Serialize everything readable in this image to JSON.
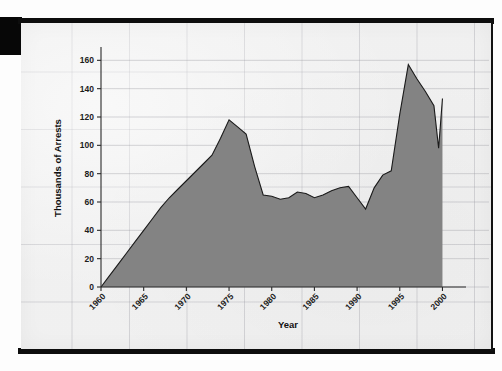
{
  "page": {
    "kind": "scanned-figure-page",
    "background_color": "#fdfdfd",
    "sheet_color": "#f4f4f4",
    "artifact_color": "#0d0d0d"
  },
  "chart_data": {
    "type": "area",
    "title": "",
    "subtitle": "",
    "xlabel": "Year",
    "ylabel": "Thousands of Arrests",
    "xlim": [
      1960,
      2001
    ],
    "ylim": [
      0,
      168
    ],
    "grid": true,
    "legend": null,
    "series_color": "#838383",
    "line_color": "#1a1a1a",
    "yticks": [
      0,
      20,
      40,
      60,
      80,
      100,
      120,
      140,
      160
    ],
    "ytick_labels": [
      "0",
      "20",
      "40",
      "60",
      "80",
      "100",
      "120",
      "140",
      "160"
    ],
    "xticks": [
      1960,
      1965,
      1970,
      1975,
      1980,
      1985,
      1990,
      1995,
      2000
    ],
    "xtick_labels": [
      "1960",
      "1965",
      "1970",
      "1975",
      "1980",
      "1985",
      "1990",
      "1995",
      "2000"
    ],
    "x": [
      1960,
      1961,
      1962,
      1963,
      1964,
      1965,
      1966,
      1967,
      1968,
      1969,
      1970,
      1971,
      1972,
      1973,
      1974,
      1975,
      1976,
      1977,
      1978,
      1979,
      1980,
      1981,
      1982,
      1983,
      1984,
      1985,
      1986,
      1987,
      1988,
      1989,
      1990,
      1991,
      1992,
      1993,
      1994,
      1995,
      1996,
      1997,
      1998,
      1999,
      2000
    ],
    "values": [
      0,
      8,
      16,
      24,
      32,
      40,
      48,
      56,
      63,
      69,
      75,
      81,
      87,
      93,
      105,
      118,
      113,
      108,
      85,
      65,
      64,
      62,
      63,
      67,
      66,
      63,
      65,
      68,
      70,
      71,
      63,
      55,
      70,
      79,
      82,
      122,
      157,
      147,
      138,
      128,
      133
    ],
    "annotations": [
      {
        "label": "first peak",
        "x": 1975,
        "y": 118
      },
      {
        "label": "trough",
        "x": 1991,
        "y": 55
      },
      {
        "label": "maximum",
        "x": 1996,
        "y": 157
      },
      {
        "label": "end dip",
        "x": 1999,
        "y": 98
      },
      {
        "label": "final value",
        "x": 2000,
        "y": 133
      }
    ]
  }
}
